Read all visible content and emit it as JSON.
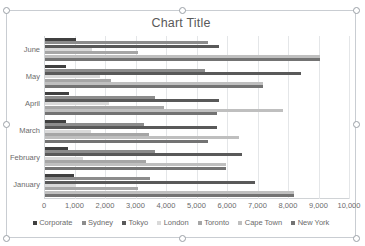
{
  "chart_object": {
    "title": "Chart Title",
    "selected": true,
    "handles": [
      "top-left",
      "top-center",
      "top-right",
      "middle-left",
      "middle-right",
      "bottom-left",
      "bottom-center",
      "bottom-right"
    ]
  },
  "chart_data": {
    "type": "bar",
    "orientation": "horizontal",
    "title": "Chart Title",
    "xlabel": "",
    "ylabel": "",
    "xlim": [
      0,
      10000
    ],
    "xticks": [
      0,
      1000,
      2000,
      3000,
      4000,
      5000,
      6000,
      7000,
      8000,
      9000,
      10000
    ],
    "xtick_labels": [
      "0",
      "1,000",
      "2,000",
      "3,000",
      "4,000",
      "5,000",
      "6,000",
      "7,000",
      "8,000",
      "9,000",
      "10,000"
    ],
    "grid": true,
    "legend_position": "bottom",
    "categories": [
      "June",
      "May",
      "April",
      "March",
      "February",
      "January"
    ],
    "series": [
      {
        "name": "Corporate",
        "color": "#404040",
        "values": [
          1000,
          700,
          800,
          700,
          750,
          950
        ]
      },
      {
        "name": "Sydney",
        "color": "#8c8c8c",
        "values": [
          5350,
          5250,
          3600,
          3250,
          3600,
          3450
        ]
      },
      {
        "name": "Tokyo",
        "color": "#595959",
        "values": [
          5700,
          8400,
          5700,
          5650,
          6450,
          6900
        ]
      },
      {
        "name": "London",
        "color": "#d9d9d9",
        "values": [
          1550,
          1800,
          2100,
          1500,
          1250,
          1000
        ]
      },
      {
        "name": "Toronto",
        "color": "#a6a6a6",
        "values": [
          3050,
          2150,
          3900,
          3400,
          3300,
          3050
        ]
      },
      {
        "name": "Cape Town",
        "color": "#bfbfbf",
        "values": [
          9000,
          7150,
          7800,
          6350,
          5950,
          8150
        ]
      },
      {
        "name": "New York",
        "color": "#737373",
        "values": [
          9000,
          7150,
          5650,
          5350,
          5950,
          8150
        ]
      }
    ]
  },
  "legend": {
    "items": [
      {
        "label": "Corporate",
        "color": "#404040"
      },
      {
        "label": "Sydney",
        "color": "#8c8c8c"
      },
      {
        "label": "Tokyo",
        "color": "#595959"
      },
      {
        "label": "London",
        "color": "#d9d9d9"
      },
      {
        "label": "Toronto",
        "color": "#a6a6a6"
      },
      {
        "label": "Cape Town",
        "color": "#bfbfbf"
      },
      {
        "label": "New York",
        "color": "#737373"
      }
    ]
  }
}
